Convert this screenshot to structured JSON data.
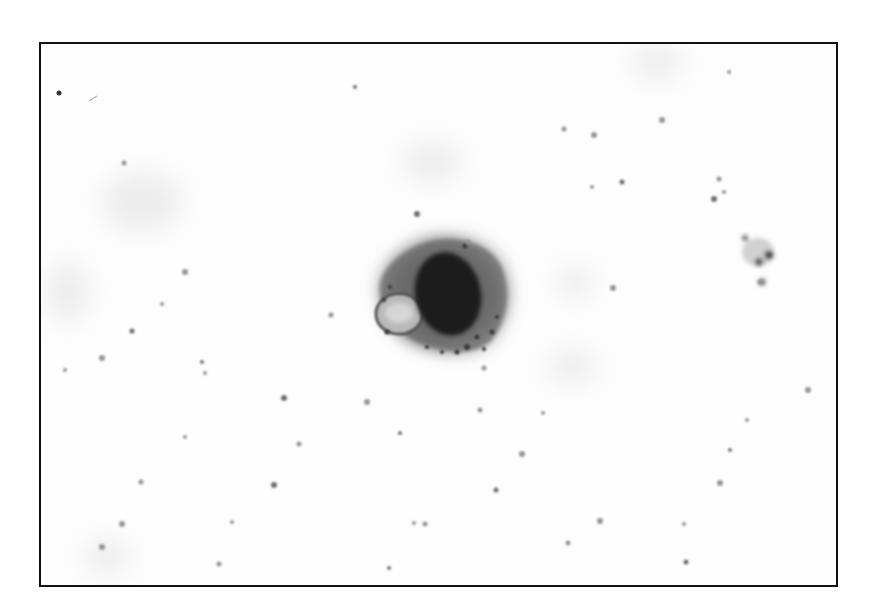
{
  "image": {
    "description": "Grayscale light micrograph of a single large cell with a dark oval nucleus and vacuolated cytoplasm on a pale background scattered with small particles",
    "frame": {
      "x": 39,
      "y": 42,
      "width": 797,
      "height": 543,
      "border_color": "#111111"
    },
    "background_color": "#fdfdfd",
    "cell": {
      "center": [
        440,
        298
      ],
      "cytoplasm_color": "#6f6f6f",
      "nucleus_color": "#1e1e1e",
      "vacuole_color": "#bdbdbd"
    },
    "small_cluster": {
      "center": [
        757,
        253
      ]
    },
    "particles": [
      [
        353,
        85
      ],
      [
        562,
        127
      ],
      [
        592,
        133
      ],
      [
        590,
        185
      ],
      [
        620,
        180
      ],
      [
        660,
        118
      ],
      [
        727,
        70
      ],
      [
        717,
        177
      ],
      [
        712,
        197
      ],
      [
        722,
        190
      ],
      [
        758,
        280
      ],
      [
        806,
        388
      ],
      [
        728,
        448
      ],
      [
        122,
        161
      ],
      [
        183,
        270
      ],
      [
        160,
        302
      ],
      [
        130,
        329
      ],
      [
        100,
        356
      ],
      [
        203,
        371
      ],
      [
        329,
        313
      ],
      [
        282,
        396
      ],
      [
        183,
        435
      ],
      [
        297,
        442
      ],
      [
        365,
        400
      ],
      [
        398,
        431
      ],
      [
        478,
        408
      ],
      [
        520,
        452
      ],
      [
        541,
        411
      ],
      [
        494,
        488
      ],
      [
        598,
        519
      ],
      [
        412,
        521
      ],
      [
        423,
        522
      ],
      [
        272,
        483
      ],
      [
        230,
        520
      ],
      [
        217,
        562
      ],
      [
        100,
        545
      ],
      [
        387,
        566
      ],
      [
        482,
        366
      ],
      [
        611,
        286
      ],
      [
        682,
        522
      ],
      [
        684,
        560
      ],
      [
        718,
        481
      ],
      [
        745,
        418
      ],
      [
        566,
        541
      ],
      [
        415,
        212
      ],
      [
        63,
        368
      ],
      [
        139,
        480
      ],
      [
        120,
        522
      ],
      [
        200,
        360
      ],
      [
        466,
        240
      ]
    ]
  }
}
